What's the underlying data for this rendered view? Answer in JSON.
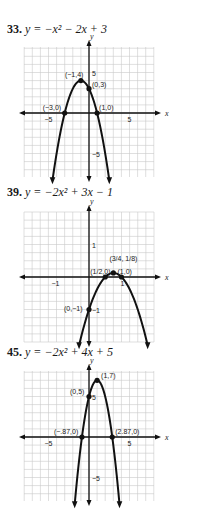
{
  "chart_data": [
    {
      "type": "line",
      "title": "33. y = −x² − 2x + 3",
      "problem_number": "33.",
      "equation": "y = −x² − 2x + 3",
      "xlabel": "x",
      "ylabel": "y",
      "grid": true,
      "xlim": [
        -8,
        8
      ],
      "ylim": [
        -8,
        8
      ],
      "x_ticks_labeled": [
        "−5",
        "5"
      ],
      "y_ticks_labeled": [
        "5",
        "−5"
      ],
      "points": [
        {
          "label": "(−1,4)",
          "x": -1,
          "y": 4
        },
        {
          "label": "(0,3)",
          "x": 0,
          "y": 3
        },
        {
          "label": "(−3,0)",
          "x": -3,
          "y": 0
        },
        {
          "label": "(1,0)",
          "x": 1,
          "y": 0
        }
      ],
      "coefficients": {
        "a": -1,
        "b": -2,
        "c": 3
      }
    },
    {
      "type": "line",
      "title": "39. y = −2x² + 3x − 1",
      "problem_number": "39.",
      "equation": "y = −2x² + 3x − 1",
      "xlabel": "x",
      "ylabel": "y",
      "grid": true,
      "xlim": [
        -2,
        2
      ],
      "ylim": [
        -2,
        2
      ],
      "x_ticks_labeled": [
        "−1",
        "1"
      ],
      "y_ticks_labeled": [
        "1",
        "−1"
      ],
      "points": [
        {
          "label": "(1/2,0)",
          "x": 0.5,
          "y": 0
        },
        {
          "label": "(3/4, 1/8)",
          "x": 0.75,
          "y": 0.125
        },
        {
          "label": "(1,0)",
          "x": 1,
          "y": 0
        },
        {
          "label": "(0,−1)",
          "x": 0,
          "y": -1
        }
      ],
      "coefficients": {
        "a": -2,
        "b": 3,
        "c": -1
      }
    },
    {
      "type": "line",
      "title": "45. y = −2x² + 4x + 5",
      "problem_number": "45.",
      "equation": "y = −2x² + 4x + 5",
      "xlabel": "x",
      "ylabel": "y",
      "grid": true,
      "xlim": [
        -8,
        8
      ],
      "ylim": [
        -8,
        8
      ],
      "x_ticks_labeled": [
        "−5",
        "5"
      ],
      "y_ticks_labeled": [
        "5",
        "−5"
      ],
      "points": [
        {
          "label": "(1,7)",
          "x": 1,
          "y": 7
        },
        {
          "label": "(0,5)",
          "x": 0,
          "y": 5
        },
        {
          "label": "(−.87,0)",
          "x": -0.87,
          "y": 0
        },
        {
          "label": "(2.87,0)",
          "x": 2.87,
          "y": 0
        }
      ],
      "coefficients": {
        "a": -2,
        "b": 4,
        "c": 5
      }
    }
  ],
  "problems": [
    {
      "num": "33.",
      "eq": "y = −x² − 2x + 3"
    },
    {
      "num": "39.",
      "eq": "y = −2x² + 3x − 1"
    },
    {
      "num": "45.",
      "eq": "y = −2x² + 4x + 5"
    }
  ]
}
